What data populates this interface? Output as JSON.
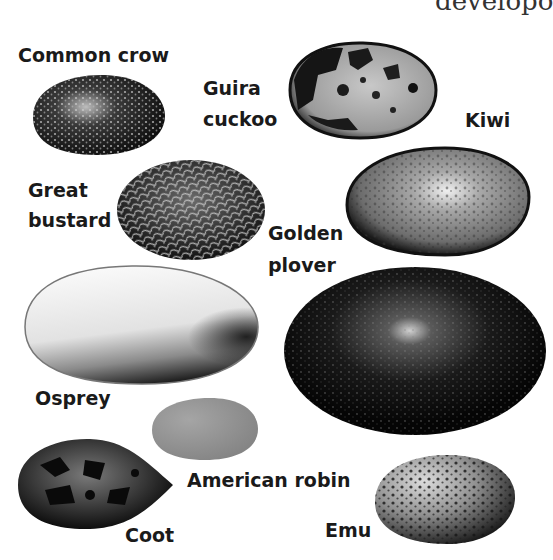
{
  "header": {
    "left_fragment": "—— ——— ————",
    "right_fragment": "developo"
  },
  "eggs": [
    {
      "name": "Common crow",
      "lines": [
        "Common crow"
      ],
      "pattern": "fine-speckled",
      "base_color": "#1c1c1c"
    },
    {
      "name": "Guira cuckoo",
      "lines": [
        "Guira",
        "cuckoo"
      ],
      "pattern": "blotched",
      "base_color": "#a8a8a8"
    },
    {
      "name": "Kiwi",
      "lines": [
        "Kiwi"
      ],
      "pattern": "mottled-light",
      "base_color": "#8e8e8e"
    },
    {
      "name": "Great bustard",
      "lines": [
        "Great",
        "bustard"
      ],
      "pattern": "streaked",
      "base_color": "#2a2a2a"
    },
    {
      "name": "Golden plover",
      "lines": [
        "Golden",
        "plover"
      ],
      "pattern": "dark-speckled",
      "base_color": "#0c0c0c"
    },
    {
      "name": "Osprey",
      "lines": [
        "Osprey"
      ],
      "pattern": "pale-with-dark-base",
      "base_color": "#e8e8e8"
    },
    {
      "name": "American robin",
      "lines": [
        "American robin"
      ],
      "pattern": "plain",
      "base_color": "#8f8f8f"
    },
    {
      "name": "Coot",
      "lines": [
        "Coot"
      ],
      "pattern": "blotched-dark",
      "base_color": "#1a1a1a"
    },
    {
      "name": "Emu",
      "lines": [
        "Emu"
      ],
      "pattern": "spotted",
      "base_color": "#9a9a9a"
    }
  ]
}
